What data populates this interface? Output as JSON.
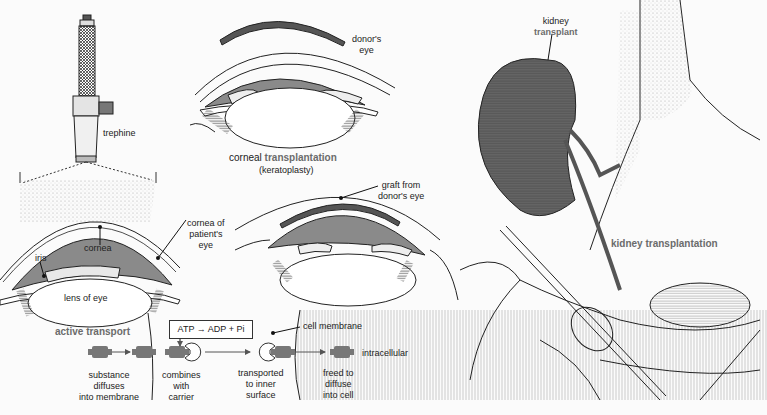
{
  "figure": {
    "panels": [
      {
        "id": "corneal",
        "title_prefix": "corneal",
        "title_highlight": "transplantation",
        "subtitle": "(keratoplasty)"
      },
      {
        "id": "kidney",
        "title_prefix": "kidney",
        "title_highlight": "transplantation"
      },
      {
        "id": "active",
        "title_prefix": "active",
        "title_highlight": "transport"
      }
    ],
    "labels": {
      "trephine": "trephine",
      "donors_eye": "donor's eye",
      "donors_eye_line1": "donor's",
      "donors_eye_line2": "eye",
      "cornea": "cornea",
      "cornea_of_patients_eye_1": "cornea of",
      "cornea_of_patients_eye_2": "patient's",
      "cornea_of_patients_eye_3": "eye",
      "iris": "iris",
      "lens_of_eye": "lens of eye",
      "graft_line1": "graft from",
      "graft_line2": "donor's eye",
      "kidney_line1": "kidney",
      "kidney_line2": "transplant",
      "cell_membrane": "cell membrane",
      "intracellular": "intracellular",
      "atp_reaction": "ATP → ADP + Pi"
    },
    "transport_steps": [
      {
        "line1": "substance",
        "line2": "diffuses",
        "line3": "into membrane"
      },
      {
        "line1": "combines",
        "line2": "with",
        "line3": "carrier"
      },
      {
        "line1": "transported",
        "line2": "to inner",
        "line3": "surface"
      },
      {
        "line1": "freed to",
        "line2": "diffuse",
        "line3": "into cell"
      }
    ],
    "colors": {
      "highlight_text": "#6b6b6b",
      "tissue_gray": "#8a8a8a",
      "dark_gray": "#555555",
      "line": "#222222"
    }
  }
}
